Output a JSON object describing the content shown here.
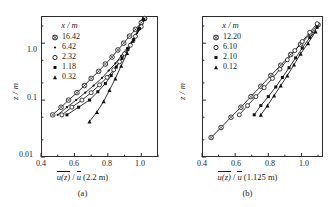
{
  "figure": {
    "panels": [
      {
        "id": "a",
        "caption": "(a)",
        "ylabel": "z / m",
        "xlabel_num": "u(z)",
        "xlabel_den": "u",
        "xlabel_ref": "(2.2 m)",
        "legend_title": "x / m",
        "legend": [
          {
            "label": "16.42",
            "marker": "crossed-circle"
          },
          {
            "label": "6.42",
            "marker": "small-dot"
          },
          {
            "label": "2.32",
            "marker": "open-circle"
          },
          {
            "label": "1.18",
            "marker": "filled-square"
          },
          {
            "label": "0.32",
            "marker": "triangle"
          }
        ],
        "yticks": [
          "1.0",
          "0.1",
          "0.01"
        ],
        "xticks": [
          "0.4",
          "0.6",
          "0.8",
          "1.0"
        ]
      },
      {
        "id": "b",
        "caption": "(b)",
        "ylabel": "z / m",
        "xlabel_num": "u(z)",
        "xlabel_den": "u",
        "xlabel_ref": "(1.125 m)",
        "legend_title": "x / m",
        "legend": [
          {
            "label": "12.20",
            "marker": "crossed-circle"
          },
          {
            "label": "6.10",
            "marker": "open-circle"
          },
          {
            "label": "2.10",
            "marker": "filled-square"
          },
          {
            "label": "0.12",
            "marker": "triangle"
          }
        ],
        "yticks": [],
        "xticks": [
          "0.4",
          "0.6",
          "0.8",
          "1.0"
        ]
      }
    ]
  },
  "chart_data": [
    {
      "type": "line",
      "title": "",
      "panel": "(a)",
      "xlabel": "u(z) / u (2.2 m)",
      "ylabel": "z / m",
      "yscale": "log",
      "xlim": [
        0.4,
        1.1
      ],
      "ylim": [
        0.01,
        3.0
      ],
      "grid": false,
      "legend_position": "upper-left",
      "legend_title": "x / m",
      "xticks": [
        0.4,
        0.6,
        0.8,
        1.0
      ],
      "xticks_minor": [
        0.5,
        0.7,
        0.9,
        1.1
      ],
      "yticks": [
        1.0,
        0.1,
        0.01
      ],
      "series": [
        {
          "name": "16.42",
          "marker": "crossed-circle",
          "x": [
            0.47,
            0.52,
            0.565,
            0.615,
            0.66,
            0.7,
            0.745,
            0.785,
            0.825,
            0.86,
            0.895,
            0.93,
            0.965,
            1.0,
            1.02
          ],
          "y": [
            0.055,
            0.075,
            0.1,
            0.135,
            0.18,
            0.24,
            0.32,
            0.43,
            0.57,
            0.76,
            1.0,
            1.33,
            1.75,
            2.3,
            2.7
          ]
        },
        {
          "name": "6.42",
          "marker": "small-dot",
          "x": [
            0.5,
            0.555,
            0.61,
            0.665,
            0.715,
            0.765,
            0.805,
            0.845,
            0.88,
            0.915,
            0.95,
            0.985,
            1.01
          ],
          "y": [
            0.055,
            0.075,
            0.1,
            0.135,
            0.18,
            0.245,
            0.33,
            0.44,
            0.6,
            0.82,
            1.15,
            1.7,
            2.6
          ]
        },
        {
          "name": "2.32",
          "marker": "open-circle",
          "x": [
            0.525,
            0.585,
            0.645,
            0.7,
            0.75,
            0.795,
            0.835,
            0.87,
            0.9,
            0.935,
            0.965,
            1.0,
            1.02
          ],
          "y": [
            0.055,
            0.075,
            0.1,
            0.135,
            0.185,
            0.25,
            0.34,
            0.47,
            0.65,
            0.92,
            1.32,
            1.95,
            2.7
          ]
        },
        {
          "name": "1.18",
          "marker": "filled-square",
          "x": [
            0.555,
            0.625,
            0.69,
            0.74,
            0.785,
            0.82,
            0.85,
            0.885,
            0.92,
            0.955,
            0.99,
            1.015
          ],
          "y": [
            0.055,
            0.075,
            0.1,
            0.14,
            0.195,
            0.27,
            0.38,
            0.54,
            0.78,
            1.15,
            1.8,
            2.6
          ]
        },
        {
          "name": "0.32",
          "marker": "triangle",
          "x": [
            0.69,
            0.735,
            0.775,
            0.81,
            0.845,
            0.88,
            0.915,
            0.95,
            0.985,
            1.01
          ],
          "y": [
            0.042,
            0.062,
            0.095,
            0.15,
            0.24,
            0.4,
            0.67,
            1.1,
            1.85,
            2.7
          ]
        }
      ]
    },
    {
      "type": "line",
      "title": "",
      "panel": "(b)",
      "xlabel": "u(z) / u (1.125 m)",
      "ylabel": "z / m",
      "yscale": "log",
      "xlim": [
        0.4,
        1.13
      ],
      "ylim": [
        0.01,
        3.0
      ],
      "grid": false,
      "legend_position": "upper-left",
      "legend_title": "x / m",
      "xticks": [
        0.4,
        0.6,
        0.8,
        1.0
      ],
      "xticks_minor": [
        0.5,
        0.7,
        0.9,
        1.1
      ],
      "yticks": [],
      "series": [
        {
          "name": "12.20",
          "marker": "crossed-circle",
          "x": [
            0.455,
            0.515,
            0.575,
            0.635,
            0.695,
            0.755,
            0.815,
            0.875,
            0.935,
            0.995,
            1.055,
            1.1
          ],
          "y": [
            0.022,
            0.033,
            0.05,
            0.075,
            0.115,
            0.175,
            0.27,
            0.41,
            0.63,
            0.96,
            1.48,
            2.1
          ]
        },
        {
          "name": "6.10",
          "marker": "open-circle",
          "x": [
            0.625,
            0.675,
            0.725,
            0.775,
            0.825,
            0.87,
            0.915,
            0.96,
            1.005,
            1.05,
            1.095
          ],
          "y": [
            0.055,
            0.08,
            0.115,
            0.165,
            0.24,
            0.35,
            0.51,
            0.74,
            1.07,
            1.55,
            2.2
          ]
        },
        {
          "name": "2.10",
          "marker": "filled-square",
          "x": [
            0.715,
            0.755,
            0.8,
            0.845,
            0.885,
            0.925,
            0.965,
            1.005,
            1.05,
            1.095
          ],
          "y": [
            0.055,
            0.08,
            0.115,
            0.17,
            0.25,
            0.37,
            0.55,
            0.82,
            1.25,
            1.9
          ]
        },
        {
          "name": "0.12",
          "marker": "triangle",
          "x": [
            0.755,
            0.795,
            0.835,
            0.875,
            0.915,
            0.955,
            0.995,
            1.04,
            1.085
          ],
          "y": [
            0.055,
            0.08,
            0.12,
            0.18,
            0.27,
            0.42,
            0.65,
            1.0,
            1.6
          ]
        }
      ]
    }
  ]
}
